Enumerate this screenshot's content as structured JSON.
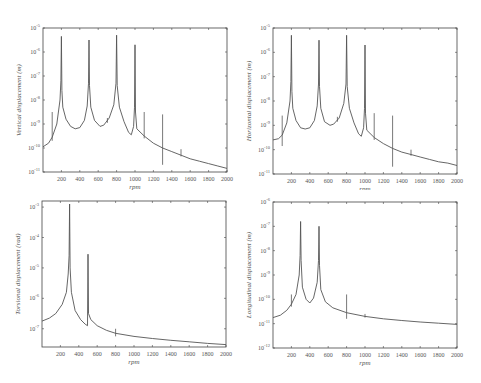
{
  "figure": {
    "background": "#ffffff",
    "line_color": "#555555",
    "axis_color": "#444444"
  },
  "chart_data": [
    {
      "id": "vertical",
      "type": "line",
      "title": "",
      "xlabel": "rpm",
      "ylabel": "Vertical displacement (m)",
      "yscale": "log",
      "xlim": [
        0,
        2000
      ],
      "ylim_exp": [
        -11,
        -5
      ],
      "x_ticks": [
        200,
        400,
        600,
        800,
        1000,
        1200,
        1400,
        1600,
        1800,
        2000
      ],
      "y_tick_exps": [
        -5,
        -6,
        -7,
        -8,
        -9,
        -10,
        -11
      ],
      "grid": false,
      "legend": null,
      "resonance_peaks_rpm": [
        200,
        500,
        800,
        1000
      ],
      "series": [
        {
          "name": "response",
          "points": [
            [
              0,
              -9.95
            ],
            [
              60,
              -9.8
            ],
            [
              100,
              -9.55
            ],
            [
              150,
              -9.0
            ],
            [
              185,
              -8.0
            ],
            [
              195,
              -7.2
            ],
            [
              200,
              -5.35
            ],
            [
              205,
              -7.6
            ],
            [
              215,
              -8.3
            ],
            [
              250,
              -8.8
            ],
            [
              300,
              -9.1
            ],
            [
              350,
              -9.2
            ],
            [
              400,
              -9.15
            ],
            [
              450,
              -8.85
            ],
            [
              480,
              -8.25
            ],
            [
              495,
              -7.3
            ],
            [
              500,
              -5.5
            ],
            [
              505,
              -7.4
            ],
            [
              520,
              -8.3
            ],
            [
              560,
              -8.85
            ],
            [
              620,
              -9.1
            ],
            [
              660,
              -9.05
            ],
            [
              720,
              -8.75
            ],
            [
              770,
              -8.2
            ],
            [
              793,
              -7.3
            ],
            [
              800,
              -5.3
            ],
            [
              807,
              -7.4
            ],
            [
              830,
              -8.3
            ],
            [
              880,
              -8.9
            ],
            [
              930,
              -9.35
            ],
            [
              960,
              -9.45
            ],
            [
              985,
              -9.1
            ],
            [
              995,
              -8.3
            ],
            [
              1000,
              -5.7
            ],
            [
              1005,
              -8.5
            ],
            [
              1020,
              -9.2
            ],
            [
              1100,
              -9.5
            ],
            [
              1200,
              -9.8
            ],
            [
              1300,
              -10.0
            ],
            [
              1400,
              -10.15
            ],
            [
              1500,
              -10.3
            ],
            [
              1600,
              -10.45
            ],
            [
              1700,
              -10.55
            ],
            [
              1800,
              -10.65
            ],
            [
              1900,
              -10.75
            ],
            [
              2000,
              -10.85
            ]
          ]
        }
      ],
      "spikes": [
        [
          100,
          -9.7,
          -8.5
        ],
        [
          700,
          -8.95,
          -8.75
        ],
        [
          1100,
          -9.6,
          -8.5
        ],
        [
          1300,
          -10.7,
          -8.6
        ],
        [
          1500,
          -10.35,
          -10.05
        ]
      ]
    },
    {
      "id": "horizontal",
      "type": "line",
      "title": "",
      "xlabel": "rpm",
      "ylabel": "Horizontal displacement (m)",
      "yscale": "log",
      "xlim": [
        0,
        2000
      ],
      "ylim_exp": [
        -11,
        -5
      ],
      "x_ticks": [
        200,
        400,
        600,
        800,
        1000,
        1200,
        1400,
        1600,
        1800,
        2000
      ],
      "y_tick_exps": [
        -5,
        -6,
        -7,
        -8,
        -9,
        -10,
        -11
      ],
      "grid": false,
      "legend": null,
      "resonance_peaks_rpm": [
        200,
        500,
        800,
        1000
      ],
      "series": [
        {
          "name": "response",
          "points": [
            [
              0,
              -9.6
            ],
            [
              60,
              -9.55
            ],
            [
              100,
              -9.4
            ],
            [
              150,
              -8.9
            ],
            [
              185,
              -8.0
            ],
            [
              195,
              -7.2
            ],
            [
              200,
              -5.3
            ],
            [
              205,
              -7.6
            ],
            [
              215,
              -8.3
            ],
            [
              250,
              -8.8
            ],
            [
              300,
              -9.1
            ],
            [
              350,
              -9.15
            ],
            [
              400,
              -9.1
            ],
            [
              450,
              -8.8
            ],
            [
              480,
              -8.2
            ],
            [
              495,
              -7.3
            ],
            [
              500,
              -5.5
            ],
            [
              505,
              -7.4
            ],
            [
              520,
              -8.3
            ],
            [
              560,
              -8.85
            ],
            [
              620,
              -9.0
            ],
            [
              660,
              -8.95
            ],
            [
              720,
              -8.7
            ],
            [
              770,
              -8.1
            ],
            [
              793,
              -7.3
            ],
            [
              800,
              -5.3
            ],
            [
              807,
              -7.4
            ],
            [
              830,
              -8.3
            ],
            [
              880,
              -8.9
            ],
            [
              930,
              -9.35
            ],
            [
              960,
              -9.45
            ],
            [
              985,
              -9.1
            ],
            [
              995,
              -8.3
            ],
            [
              1000,
              -5.7
            ],
            [
              1005,
              -8.5
            ],
            [
              1020,
              -9.2
            ],
            [
              1100,
              -9.5
            ],
            [
              1200,
              -9.75
            ],
            [
              1300,
              -9.95
            ],
            [
              1400,
              -10.1
            ],
            [
              1500,
              -10.2
            ],
            [
              1600,
              -10.3
            ],
            [
              1700,
              -10.4
            ],
            [
              1800,
              -10.5
            ],
            [
              1900,
              -10.55
            ],
            [
              2000,
              -10.65
            ]
          ]
        }
      ],
      "spikes": [
        [
          100,
          -9.85,
          -8.6
        ],
        [
          700,
          -8.85,
          -8.65
        ],
        [
          1100,
          -9.6,
          -8.5
        ],
        [
          1300,
          -10.7,
          -8.6
        ],
        [
          1500,
          -10.25,
          -10.0
        ]
      ]
    },
    {
      "id": "torsional",
      "type": "line",
      "title": "",
      "xlabel": "rpm",
      "ylabel": "Torsional displacement (rad)",
      "yscale": "log",
      "xlim": [
        0,
        2000
      ],
      "ylim_exp": [
        -7.6,
        -2.8
      ],
      "x_ticks": [
        200,
        400,
        600,
        800,
        1000,
        1200,
        1400,
        1600,
        1800,
        2000
      ],
      "y_tick_exps": [
        -3,
        -4,
        -5,
        -6,
        -7
      ],
      "grid": false,
      "legend": null,
      "resonance_peaks_rpm": [
        300,
        500
      ],
      "series": [
        {
          "name": "response",
          "points": [
            [
              0,
              -6.75
            ],
            [
              80,
              -6.65
            ],
            [
              150,
              -6.5
            ],
            [
              220,
              -6.2
            ],
            [
              265,
              -5.8
            ],
            [
              285,
              -5.2
            ],
            [
              295,
              -4.6
            ],
            [
              300,
              -2.9
            ],
            [
              305,
              -5.0
            ],
            [
              320,
              -5.8
            ],
            [
              360,
              -6.4
            ],
            [
              420,
              -6.7
            ],
            [
              470,
              -6.85
            ],
            [
              495,
              -6.9
            ],
            [
              500,
              -4.55
            ],
            [
              505,
              -6.5
            ],
            [
              530,
              -6.7
            ],
            [
              600,
              -6.9
            ],
            [
              700,
              -7.05
            ],
            [
              800,
              -7.15
            ],
            [
              1000,
              -7.25
            ],
            [
              1200,
              -7.32
            ],
            [
              1400,
              -7.38
            ],
            [
              1600,
              -7.43
            ],
            [
              1800,
              -7.48
            ],
            [
              2000,
              -7.52
            ]
          ]
        }
      ],
      "spikes": [
        [
          800,
          -7.25,
          -7.0
        ]
      ]
    },
    {
      "id": "longitudinal",
      "type": "line",
      "title": "",
      "xlabel": "rpm",
      "ylabel": "Longitudinal displacement (m)",
      "yscale": "log",
      "xlim": [
        0,
        2000
      ],
      "ylim_exp": [
        -12,
        -6
      ],
      "x_ticks": [
        200,
        400,
        600,
        800,
        1000,
        1200,
        1400,
        1600,
        1800,
        2000
      ],
      "y_tick_exps": [
        -6,
        -7,
        -8,
        -9,
        -10,
        -11,
        -12
      ],
      "grid": false,
      "legend": null,
      "resonance_peaks_rpm": [
        300,
        500
      ],
      "series": [
        {
          "name": "response",
          "points": [
            [
              0,
              -10.75
            ],
            [
              80,
              -10.65
            ],
            [
              150,
              -10.45
            ],
            [
              200,
              -10.2
            ],
            [
              250,
              -9.8
            ],
            [
              285,
              -9.0
            ],
            [
              295,
              -8.2
            ],
            [
              300,
              -6.8
            ],
            [
              305,
              -8.4
            ],
            [
              320,
              -9.5
            ],
            [
              360,
              -10.0
            ],
            [
              400,
              -10.15
            ],
            [
              440,
              -9.95
            ],
            [
              480,
              -9.3
            ],
            [
              495,
              -8.4
            ],
            [
              500,
              -7.0
            ],
            [
              505,
              -8.6
            ],
            [
              520,
              -9.6
            ],
            [
              570,
              -10.1
            ],
            [
              650,
              -10.35
            ],
            [
              800,
              -10.55
            ],
            [
              1000,
              -10.7
            ],
            [
              1200,
              -10.8
            ],
            [
              1400,
              -10.87
            ],
            [
              1600,
              -10.93
            ],
            [
              1800,
              -10.98
            ],
            [
              2000,
              -11.03
            ]
          ]
        }
      ],
      "spikes": [
        [
          200,
          -10.3,
          -9.8
        ],
        [
          800,
          -10.8,
          -9.8
        ],
        [
          1000,
          -10.75,
          -10.6
        ]
      ]
    }
  ]
}
